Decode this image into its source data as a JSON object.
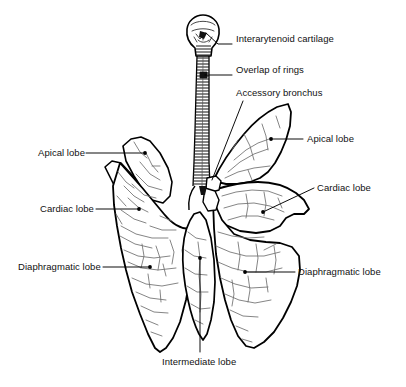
{
  "figure": {
    "background_color": "#ffffff",
    "ink_color": "#000000",
    "detail_color": "#6b6b6b",
    "width": 406,
    "height": 387
  },
  "labels": {
    "interarytenoid_cartilage": "Interarytenoid cartilage",
    "overlap_of_rings": "Overlap of rings",
    "accessory_bronchus": "Accessory bronchus",
    "apical_lobe_right": "Apical lobe",
    "cardiac_lobe_right": "Cardiac lobe",
    "diaphragmatic_lobe_right": "Diaphragmatic lobe",
    "apical_lobe_left": "Apical lobe",
    "cardiac_lobe_left": "Cardiac lobe",
    "diaphragmatic_lobe_left": "Diaphragmatic lobe",
    "intermediate_lobe": "Intermediate lobe"
  },
  "callouts": [
    {
      "id": "interarytenoid-cartilage",
      "text": "Interarytenoid cartilage",
      "text_x": 236,
      "text_y": 39,
      "align": "left",
      "leader": [
        [
          232,
          44
        ],
        [
          218,
          44
        ],
        [
          206,
          33
        ]
      ],
      "marker": "none"
    },
    {
      "id": "overlap-of-rings",
      "text": "Overlap of rings",
      "text_x": 236,
      "text_y": 70,
      "align": "left",
      "leader": [
        [
          232,
          75
        ],
        [
          205,
          75
        ]
      ],
      "marker": "none"
    },
    {
      "id": "accessory-bronchus",
      "text": "Accessory bronchus",
      "text_x": 236,
      "text_y": 93,
      "align": "left",
      "leader": [
        [
          243,
          101
        ],
        [
          212,
          180
        ]
      ],
      "marker": "none"
    },
    {
      "id": "apical-lobe-right",
      "text": "Apical lobe",
      "text_x": 307,
      "text_y": 133,
      "align": "left",
      "leader": [
        [
          303,
          139
        ],
        [
          271,
          139
        ]
      ],
      "marker": "dot",
      "marker_x": 271,
      "marker_y": 139
    },
    {
      "id": "cardiac-lobe-right",
      "text": "Cardiac lobe",
      "text_x": 317,
      "text_y": 182,
      "align": "left",
      "leader": [
        [
          314,
          188
        ],
        [
          263,
          212
        ]
      ],
      "marker": "dot",
      "marker_x": 263,
      "marker_y": 212
    },
    {
      "id": "diaphragmatic-lobe-right",
      "text": "Diaphragmatic lobe",
      "text_x": 298,
      "text_y": 266,
      "align": "left",
      "leader": [
        [
          295,
          272
        ],
        [
          245,
          272
        ]
      ],
      "marker": "dot",
      "marker_x": 245,
      "marker_y": 272
    },
    {
      "id": "apical-lobe-left",
      "text": "Apical lobe",
      "text_x": 38,
      "text_y": 147,
      "align": "left",
      "leader": [
        [
          86,
          153
        ],
        [
          145,
          153
        ]
      ],
      "marker": "dot",
      "marker_x": 145,
      "marker_y": 153
    },
    {
      "id": "cardiac-lobe-left",
      "text": "Cardiac lobe",
      "text_x": 40,
      "text_y": 203,
      "align": "left",
      "leader": [
        [
          96,
          209
        ],
        [
          139,
          209
        ]
      ],
      "marker": "dot",
      "marker_x": 139,
      "marker_y": 209
    },
    {
      "id": "diaphragmatic-lobe-left",
      "text": "Diaphragmatic lobe",
      "text_x": 18,
      "text_y": 261,
      "align": "left",
      "leader": [
        [
          103,
          267
        ],
        [
          150,
          267
        ]
      ],
      "marker": "dot",
      "marker_x": 150,
      "marker_y": 267
    },
    {
      "id": "intermediate-lobe",
      "text": "Intermediate lobe",
      "text_x": 162,
      "text_y": 360,
      "align": "left",
      "leader": [
        [
          200,
          352
        ],
        [
          200,
          258
        ]
      ],
      "marker": "dot",
      "marker_x": 200,
      "marker_y": 258
    }
  ],
  "anatomy": {
    "larynx_label": "larynx",
    "trachea_label": "trachea with cartilage rings",
    "ring_count": 40,
    "left_lung_label": "left lung",
    "right_lung_label": "right lung"
  }
}
